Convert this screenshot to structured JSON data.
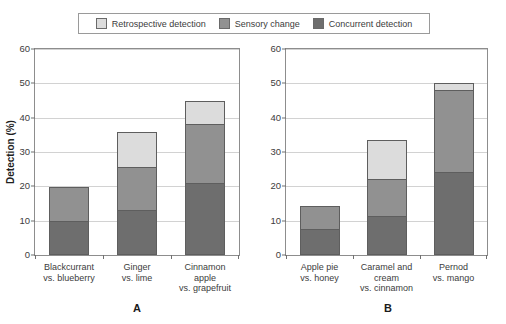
{
  "legend": {
    "position": "top-center",
    "entries": [
      {
        "label": "Retrospective detection",
        "color": "#dcdcdc",
        "key": "retrospective"
      },
      {
        "label": "Sensory change",
        "color": "#919191",
        "key": "sensory"
      },
      {
        "label": "Concurrent detection",
        "color": "#6e6e6e",
        "key": "concurrent"
      }
    ]
  },
  "chart_data": {
    "type": "bar",
    "stacked": true,
    "title": "",
    "xlabel": "",
    "ylabel": "Detection (%)",
    "ylim": [
      0,
      60
    ],
    "yticks": [
      0,
      10,
      20,
      30,
      40,
      50,
      60
    ],
    "grid": true,
    "legend_position": "top-center",
    "series": [
      {
        "name": "Concurrent detection",
        "color": "#6e6e6e"
      },
      {
        "name": "Sensory change",
        "color": "#919191"
      },
      {
        "name": "Retrospective detection",
        "color": "#dcdcdc"
      }
    ],
    "panels": [
      {
        "letter": "A",
        "categories": [
          "Blackcurrant\nvs. blueberry",
          "Ginger\nvs. lime",
          "Cinnamon\napple\nvs. grapefruit"
        ],
        "values": {
          "concurrent": [
            10.0,
            13.0,
            21.0
          ],
          "sensory": [
            10.0,
            13.0,
            17.5
          ],
          "retrospective": [
            0.0,
            10.3,
            7.0
          ]
        },
        "totals": [
          20.0,
          36.3,
          45.5
        ]
      },
      {
        "letter": "B",
        "categories": [
          "Apple pie\nvs. honey",
          "Caramel and\ncream\nvs. cinnamon",
          "Pernod\nvs. mango"
        ],
        "values": {
          "concurrent": [
            7.5,
            11.3,
            24.3
          ],
          "sensory": [
            7.2,
            11.0,
            24.2
          ],
          "retrospective": [
            0.0,
            11.7,
            2.3
          ]
        },
        "totals": [
          14.7,
          34.0,
          50.8
        ]
      }
    ]
  },
  "axis": {
    "ytick_labels": [
      "0",
      "10",
      "20",
      "30",
      "40",
      "50",
      "60"
    ],
    "y_title": "Detection (%)"
  },
  "panel_labels": {
    "a": "A",
    "b": "B"
  }
}
